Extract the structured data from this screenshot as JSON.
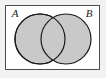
{
  "figure": {
    "kind": "venn-diagram",
    "title": "",
    "background_color": "#f2f2f0",
    "universal_set": {
      "shape": "rectangle",
      "fill_color": "#ffffff",
      "stroke_color": "#4d4d4d",
      "stroke_width": 1,
      "x": 5.5,
      "y": 5.5,
      "width": 94,
      "height": 64
    },
    "sets": [
      {
        "label": "A",
        "label_x": 15,
        "label_y": 17,
        "cx": 40,
        "cy": 39,
        "r": 25,
        "fill_color": "#c9c9c9",
        "stroke_color": "#1a1a1a",
        "stroke_width": 1.2
      },
      {
        "label": "B",
        "label_x": 89,
        "label_y": 17,
        "cx": 66,
        "cy": 39,
        "r": 25,
        "fill_color": "#c9c9c9",
        "stroke_color": "#1a1a1a",
        "stroke_width": 1.2
      }
    ],
    "intersection": {
      "name": "A-intersect-B",
      "shaded": true,
      "fill_color": "#c9c9c9"
    }
  }
}
